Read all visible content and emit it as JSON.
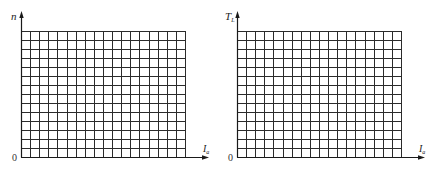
{
  "figures": [
    {
      "id": "left",
      "y_axis_label": "n",
      "y_axis_subscript": "",
      "x_axis_label": "I",
      "x_axis_subscript": "a",
      "origin_label": "0",
      "grid": {
        "x0": 21,
        "y0": 31,
        "x1": 185,
        "y1": 157,
        "cols": 18,
        "rows": 14
      },
      "axis": {
        "y_tip": 11,
        "x_tip": 209
      }
    },
    {
      "id": "right",
      "y_axis_label": "T",
      "y_axis_subscript": "L",
      "x_axis_label": "I",
      "x_axis_subscript": "a",
      "origin_label": "0",
      "grid": {
        "x0": 237,
        "y0": 31,
        "x1": 401,
        "y1": 157,
        "cols": 18,
        "rows": 14
      },
      "axis": {
        "y_tip": 11,
        "x_tip": 425
      }
    }
  ],
  "chart_data": [
    {
      "type": "line",
      "title": "",
      "xlabel": "I_a",
      "ylabel": "n",
      "series": [],
      "grid": true,
      "grid_cells": {
        "columns": 18,
        "rows": 14
      },
      "origin": "0",
      "note": "Blank graph-paper grid for plotting n vs I_a"
    },
    {
      "type": "line",
      "title": "",
      "xlabel": "I_a",
      "ylabel": "T_L",
      "series": [],
      "grid": true,
      "grid_cells": {
        "columns": 18,
        "rows": 14
      },
      "origin": "0",
      "note": "Blank graph-paper grid for plotting T_L vs I_a"
    }
  ],
  "colors": {
    "grid": "#2b2b2b",
    "axis": "#1a1a1a",
    "background": "#ffffff"
  }
}
